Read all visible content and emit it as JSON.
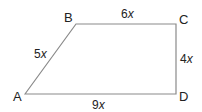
{
  "diagram": {
    "type": "trapezoid",
    "stroke_color": "#8a8a8a",
    "vertices": [
      {
        "label": "A",
        "x": 25,
        "y": 94
      },
      {
        "label": "B",
        "x": 76,
        "y": 24
      },
      {
        "label": "C",
        "x": 176,
        "y": 24
      },
      {
        "label": "D",
        "x": 176,
        "y": 94
      }
    ],
    "sides": {
      "AB": {
        "coef": "5",
        "var": "x"
      },
      "BC": {
        "coef": "6",
        "var": "x"
      },
      "CD": {
        "coef": "4",
        "var": "x"
      },
      "AD": {
        "coef": "9",
        "var": "x"
      }
    }
  }
}
